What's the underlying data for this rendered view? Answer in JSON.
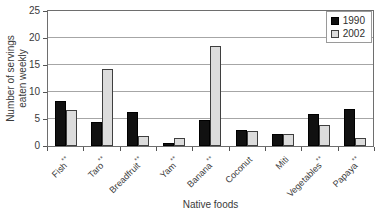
{
  "figure": {
    "background": "#ffffff",
    "text_color": "#3a3a3a",
    "gridline_color": "#a6a6a6"
  },
  "chart_data": {
    "type": "bar",
    "title": "",
    "xlabel": "Native foods",
    "ylabel": "Number of servings eaten weekly",
    "ylabel_lines": [
      "Number of servings",
      "eaten weekly"
    ],
    "ylim": [
      0,
      25
    ],
    "yticks": [
      0,
      5,
      10,
      15,
      20,
      25
    ],
    "grid": "horizontal",
    "legend_position": "top-right-inside",
    "categories": [
      "Fish**",
      "Taro**",
      "Breadfruit**",
      "Yam**",
      "Banana**",
      "Coconut",
      "Miti",
      "Vegetables**",
      "Papaya**"
    ],
    "series": [
      {
        "name": "1990",
        "color": "#111111",
        "values": [
          8.3,
          4.5,
          6.3,
          0.5,
          4.8,
          2.9,
          2.3,
          6.0,
          6.9
        ]
      },
      {
        "name": "2002",
        "color": "#dcdcdc",
        "values": [
          6.6,
          14.3,
          1.9,
          1.4,
          18.5,
          2.8,
          2.2,
          3.9,
          1.4
        ]
      }
    ]
  }
}
